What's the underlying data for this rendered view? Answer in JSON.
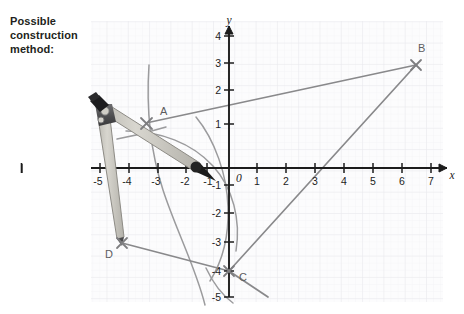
{
  "caption": {
    "line1": "Possible",
    "line2": "construction",
    "line3": "method:"
  },
  "axes": {
    "x_label": "x",
    "y_label": "y",
    "origin_label": "0",
    "x_ticks": [
      "-5",
      "-4",
      "-3",
      "-2",
      "-1",
      "1",
      "2",
      "3",
      "4",
      "5",
      "6",
      "7"
    ],
    "y_ticks": [
      "4",
      "3",
      "2",
      "1",
      "-1",
      "-2",
      "-3",
      "-4",
      "-5"
    ],
    "x_range": [
      -5.6,
      7.6
    ],
    "y_range": [
      -5.4,
      4.4
    ]
  },
  "points": {
    "A": {
      "label": "A",
      "x": -2.5,
      "y": 1.3
    },
    "B": {
      "label": "B",
      "x": 6.0,
      "y": 3.0
    },
    "C": {
      "label": "C",
      "x": 0.0,
      "y": -4.0
    },
    "D": {
      "label": "D",
      "x": -3.6,
      "y": -3.1
    }
  },
  "colors": {
    "text": "#231f20",
    "axis": "#1a1a1a",
    "grid_minor": "#f0f0f2",
    "grid_major": "#e4e4e8",
    "plot_bg": "#fbfbfc",
    "construction_line": "#8a8a8c",
    "arc": "#9a9a9c",
    "compass_body": "#c9c7c0",
    "compass_edge": "#8d8b85",
    "compass_hinge": "#5a5a5c",
    "pencil_tip": "#1b1b1b"
  },
  "segments": [
    {
      "name": "segment-a-b",
      "from": "A",
      "to": "B"
    },
    {
      "name": "segment-b-c",
      "from": "B",
      "to": "C"
    },
    {
      "name": "segment-d-c",
      "from": "D",
      "to": "C"
    }
  ],
  "tool": {
    "name": "compass",
    "handle_label": "compass-handle",
    "pencil_label": "compass-pencil-tip",
    "pivot_label": "compass-pivot-leg"
  }
}
